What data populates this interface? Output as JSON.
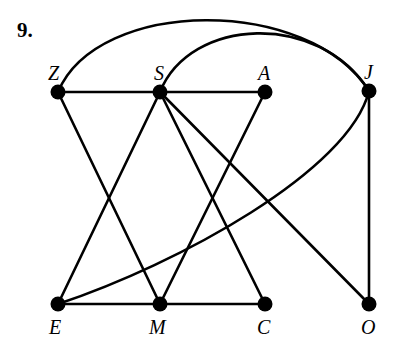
{
  "problem": {
    "number": "9."
  },
  "graph": {
    "nodes": [
      {
        "id": "Z",
        "label": "Z",
        "x": 58,
        "y": 92,
        "label_x": 48,
        "label_y": 80
      },
      {
        "id": "S",
        "label": "S",
        "x": 160,
        "y": 92,
        "label_x": 154,
        "label_y": 80
      },
      {
        "id": "A",
        "label": "A",
        "x": 265,
        "y": 92,
        "label_x": 258,
        "label_y": 80
      },
      {
        "id": "J",
        "label": "J",
        "x": 369,
        "y": 91,
        "label_x": 364,
        "label_y": 79
      },
      {
        "id": "E",
        "label": "E",
        "x": 58,
        "y": 304,
        "label_x": 49,
        "label_y": 334
      },
      {
        "id": "M",
        "label": "M",
        "x": 160,
        "y": 304,
        "label_x": 149,
        "label_y": 334
      },
      {
        "id": "C",
        "label": "C",
        "x": 265,
        "y": 304,
        "label_x": 257,
        "label_y": 334
      },
      {
        "id": "O",
        "label": "O",
        "x": 369,
        "y": 304,
        "label_x": 361,
        "label_y": 334
      }
    ],
    "edges": [
      {
        "from": "Z",
        "to": "S",
        "shape": "line"
      },
      {
        "from": "S",
        "to": "A",
        "shape": "line"
      },
      {
        "from": "E",
        "to": "M",
        "shape": "line"
      },
      {
        "from": "M",
        "to": "C",
        "shape": "line"
      },
      {
        "from": "Z",
        "to": "M",
        "shape": "line"
      },
      {
        "from": "S",
        "to": "E",
        "shape": "line"
      },
      {
        "from": "S",
        "to": "C",
        "shape": "line"
      },
      {
        "from": "S",
        "to": "O",
        "shape": "line"
      },
      {
        "from": "A",
        "to": "M",
        "shape": "line"
      },
      {
        "from": "J",
        "to": "O",
        "shape": "line"
      },
      {
        "from": "Z",
        "to": "J",
        "shape": "arc-top-outer"
      },
      {
        "from": "S",
        "to": "J",
        "shape": "arc-top-inner"
      },
      {
        "from": "E",
        "to": "J",
        "shape": "curve"
      }
    ]
  }
}
